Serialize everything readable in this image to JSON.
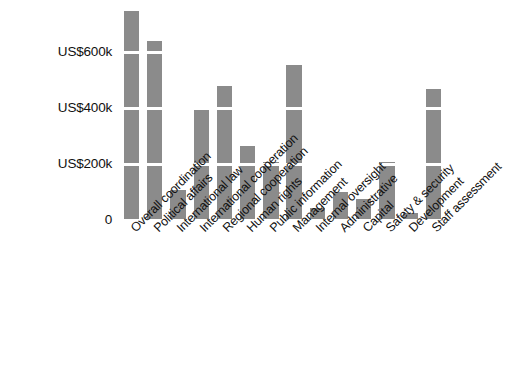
{
  "chart_data": {
    "type": "bar",
    "title": "",
    "subtitle": "",
    "xlabel": "",
    "ylabel": "",
    "categories": [
      "Overall coordination",
      "Political affairs",
      "International law",
      "International cooperation",
      "Regional cooperation",
      "Human rights",
      "Public information",
      "Management",
      "Internal oversight",
      "Administrative",
      "Capital",
      "Safety & security",
      "Development",
      "Staff assessment"
    ],
    "values": [
      742000,
      634000,
      105000,
      400000,
      474000,
      260000,
      202000,
      551000,
      40000,
      97000,
      72000,
      202000,
      22000,
      465000
    ],
    "ylim": [
      0,
      760000
    ],
    "yticks": [
      0,
      200000,
      400000,
      600000
    ],
    "ytick_labels": [
      "0",
      "US$200k",
      "US$400k",
      "US$600k"
    ],
    "grid": "horizontal-white-over-bars",
    "legend": "none",
    "bar_color": "#8b8b8b",
    "background_color": "#ffffff",
    "tick_label_color": "#111111"
  }
}
